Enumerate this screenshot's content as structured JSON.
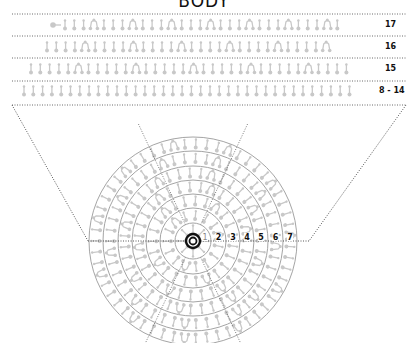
{
  "title": "BODY",
  "rows": [
    {
      "label": "17",
      "y": 25,
      "line_y": 14,
      "start_x": 53,
      "count": 29,
      "pattern": "iiiA",
      "lead": "ball"
    },
    {
      "label": "16",
      "y": 47,
      "line_y": 36,
      "start_x": 47,
      "count": 30,
      "pattern": "iiiiA",
      "lead": ""
    },
    {
      "label": "15",
      "y": 69,
      "line_y": 58,
      "start_x": 31,
      "count": 34,
      "pattern": "iiiiiA",
      "lead": ""
    },
    {
      "label": "8 - 14",
      "y": 91,
      "line_y": 81,
      "start_x": 24,
      "count": 36,
      "pattern": "i",
      "lead": ""
    }
  ],
  "disc": {
    "center": [
      193,
      241
    ],
    "rings": [
      {
        "label": "1",
        "radius": 18
      },
      {
        "label": "2",
        "radius": 33
      },
      {
        "label": "3",
        "radius": 47
      },
      {
        "label": "4",
        "radius": 61
      },
      {
        "label": "5",
        "radius": 75
      },
      {
        "label": "6",
        "radius": 90
      },
      {
        "label": "7",
        "radius": 104
      }
    ]
  },
  "colors": {
    "glyph": "#c8c8c8",
    "ring": "#9a9a9a",
    "dotted": "#444444",
    "center": "#111111"
  }
}
